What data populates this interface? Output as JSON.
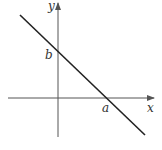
{
  "diagram": {
    "type": "line-graph",
    "axes": {
      "x_label": "x",
      "y_label": "y"
    },
    "line": {
      "description": "line with negative slope crossing y-axis at b and x-axis at a"
    },
    "intercepts": {
      "y_intercept_label": "b",
      "x_intercept_label": "a"
    },
    "colors": {
      "axis": "#555555",
      "line": "#222222",
      "text": "#333333"
    }
  }
}
